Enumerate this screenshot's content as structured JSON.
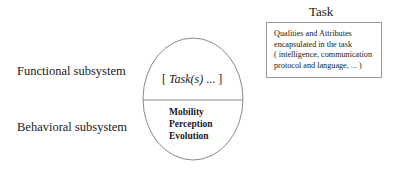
{
  "labels": {
    "functional": "Functional subsystem",
    "behavioral": "Behavioral subsystem"
  },
  "task_box": {
    "title": "Task",
    "lines": [
      "Qualities and Attributes",
      "encapsulated in the task",
      "( intelligence, communication",
      "protocol and language, ... )"
    ]
  },
  "ellipse": {
    "top": {
      "open": "[ ",
      "task": "Task(s)",
      "close": " ... ]"
    },
    "bottom": [
      "Mobility",
      "Perception",
      "Evolution"
    ]
  }
}
